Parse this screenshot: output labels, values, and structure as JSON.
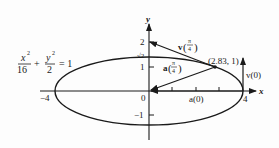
{
  "diagram": {
    "equation": {
      "x_num": "x",
      "x_exp": "2",
      "x_den": "16",
      "plus": "+",
      "y_num": "y",
      "y_exp": "2",
      "y_den": "2",
      "rhs": "= 1"
    },
    "axes": {
      "x_label": "x",
      "y_label": "y",
      "origin_label": "0",
      "x_ticks": [
        "−4",
        "4"
      ],
      "y_ticks": [
        "2",
        "√2",
        "1",
        "−1"
      ]
    },
    "point": {
      "label": "(2.83, 1)"
    },
    "vectors": {
      "v_pi4": {
        "prefix": "v",
        "num": "π",
        "den": "4"
      },
      "a_pi4": {
        "prefix": "a",
        "num": "π",
        "den": "4"
      },
      "v0": "v(0)",
      "a0": "a(0)"
    },
    "colors": {
      "ink": "#1a1a1a",
      "background": "#fdfdfd"
    }
  }
}
